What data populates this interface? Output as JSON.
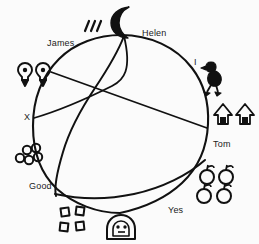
{
  "diagram": {
    "kind": "circular-partition-diagram",
    "style": "hand-drawn line art, black ink on off-white paper",
    "background_color": "#fbfbfb",
    "ink_color": "#111111",
    "circle": {
      "center_x": 121,
      "center_y": 124,
      "radius_x": 87,
      "radius_y": 89
    },
    "labels": [
      {
        "id": "james",
        "text": "James",
        "x": 47,
        "y": 38,
        "position": "upper-left outside"
      },
      {
        "id": "helen",
        "text": "Helen",
        "x": 142,
        "y": 28,
        "position": "top outside"
      },
      {
        "id": "i",
        "text": "I",
        "x": 194,
        "y": 57,
        "position": "upper-right outside"
      },
      {
        "id": "tom",
        "text": "Tom",
        "x": 213,
        "y": 139,
        "position": "right outside"
      },
      {
        "id": "yes",
        "text": "Yes",
        "x": 168,
        "y": 205,
        "position": "lower-right outside"
      },
      {
        "id": "good",
        "text": "Good",
        "x": 29,
        "y": 181,
        "position": "lower-left outside"
      },
      {
        "id": "x",
        "text": "X",
        "x": 24,
        "y": 112,
        "position": "left outside"
      }
    ],
    "icon_groups": [
      {
        "id": "tally-marks",
        "name": "tally-marks-icon",
        "count": 3,
        "x": 87,
        "y": 24,
        "near_label": "James"
      },
      {
        "id": "crescent-moon",
        "name": "crescent-moon-icon",
        "count": 1,
        "x": 115,
        "y": 10,
        "near_label": "Helen"
      },
      {
        "id": "bird",
        "name": "bird-icon",
        "count": 1,
        "x": 205,
        "y": 68,
        "near_label": "I"
      },
      {
        "id": "trees",
        "name": "tree-icon",
        "count": 2,
        "x": 216,
        "y": 108,
        "near_label": "Tom"
      },
      {
        "id": "apples",
        "name": "apple-icon",
        "count": 4,
        "x": 203,
        "y": 163,
        "near_label": "Yes"
      },
      {
        "id": "face-mask",
        "name": "face-mask-icon",
        "count": 1,
        "x": 108,
        "y": 216,
        "near_label": "bottom-center"
      },
      {
        "id": "squares",
        "name": "square-icon",
        "count": 4,
        "x": 60,
        "y": 206,
        "near_label": "bottom-left"
      },
      {
        "id": "circles",
        "name": "circle-cluster-icon",
        "count": 5,
        "x": 11,
        "y": 145,
        "near_label": "Good"
      },
      {
        "id": "bulbs",
        "name": "bulb-icon",
        "count": 2,
        "x": 20,
        "y": 60,
        "near_label": "James"
      }
    ],
    "interior_lines": [
      {
        "id": "chord-helen-to-good",
        "description": "long curved chord from top (Helen) sweeping down-left to lower-left rim"
      },
      {
        "id": "chord-upperleft-to-tom",
        "description": "straight chord from upper-left rim across to right rim near Tom"
      },
      {
        "id": "chord-x-to-left",
        "description": "short chord converging at left rim at X"
      },
      {
        "id": "arc-bottom",
        "description": "wide arc across lower half from lower-left rim to right rim near Tom"
      }
    ]
  }
}
